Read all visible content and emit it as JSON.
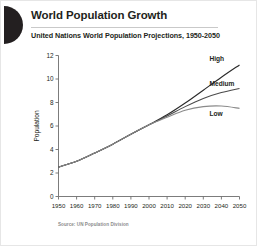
{
  "header": {
    "logo_icon": "half-circle-logo",
    "title": "World Population Growth",
    "subtitle": "United Nations World Population Projections, 1950-2050"
  },
  "footer": {
    "source": "Source: UN Population Division"
  },
  "colors": {
    "background": "#ffffff",
    "ink": "#231f20",
    "rule": "#c9c9c9",
    "axis": "#6d6d6d",
    "high": "#2b2b2b",
    "medium": "#4a4a4a",
    "low": "#8a8a8a",
    "footer_text": "#8c8c8c"
  },
  "chart_data": {
    "type": "line",
    "title": "World Population Growth",
    "subtitle": "United Nations World Population Projections, 1950-2050",
    "xlabel": "",
    "ylabel": "Population",
    "xlim": [
      1950,
      2050
    ],
    "ylim": [
      0,
      12
    ],
    "yticks": [
      0,
      2,
      4,
      6,
      8,
      10,
      12
    ],
    "xticks": [
      1950,
      1960,
      1970,
      1980,
      1990,
      2000,
      2010,
      2020,
      2030,
      2040,
      2050
    ],
    "grid": false,
    "legend_position": "inline-right-end-labels",
    "x": [
      1950,
      1960,
      1970,
      1980,
      1990,
      2000,
      2010,
      2020,
      2030,
      2040,
      2050
    ],
    "series": [
      {
        "name": "High",
        "color": "#2b2b2b",
        "values": [
          2.5,
          3.0,
          3.7,
          4.45,
          5.3,
          6.1,
          6.95,
          7.95,
          9.05,
          10.15,
          11.2
        ]
      },
      {
        "name": "Medium",
        "color": "#4a4a4a",
        "values": [
          2.5,
          3.0,
          3.7,
          4.45,
          5.3,
          6.1,
          6.85,
          7.65,
          8.35,
          8.85,
          9.2
        ]
      },
      {
        "name": "Low",
        "color": "#8a8a8a",
        "values": [
          2.5,
          3.0,
          3.7,
          4.45,
          5.3,
          6.1,
          6.75,
          7.35,
          7.65,
          7.7,
          7.5
        ]
      }
    ]
  }
}
